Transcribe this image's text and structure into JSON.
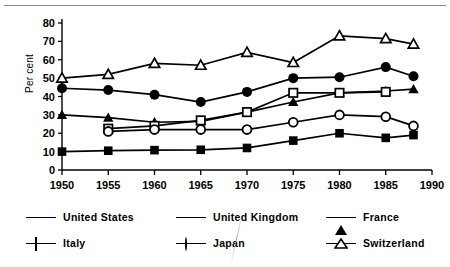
{
  "figure": {
    "toprule": true
  },
  "axes": {
    "ylabel": "Per cent",
    "yticks": [
      "0",
      "10",
      "20",
      "30",
      "40",
      "50",
      "60",
      "70",
      "80"
    ],
    "xticks": [
      "1950",
      "1955",
      "1960",
      "1965",
      "1970",
      "1975",
      "1980",
      "1985",
      "1990"
    ]
  },
  "legend": {
    "items": [
      {
        "label": "United States",
        "marker": "filled-square",
        "row": 1,
        "col": 1
      },
      {
        "label": "United Kingdom",
        "marker": "filled-circle",
        "row": 1,
        "col": 2
      },
      {
        "label": "France",
        "marker": "filled-triangle",
        "row": 1,
        "col": 3
      },
      {
        "label": "Italy",
        "marker": "open-square",
        "row": 2,
        "col": 1
      },
      {
        "label": "Japan",
        "marker": "open-circle",
        "row": 2,
        "col": 2
      },
      {
        "label": "Switzerland",
        "marker": "open-triangle",
        "row": 2,
        "col": 3
      }
    ]
  },
  "chart_data": {
    "type": "line",
    "title": "",
    "xlabel": "",
    "ylabel": "Per cent",
    "xlim": [
      1950,
      1990
    ],
    "ylim": [
      0,
      80
    ],
    "xticks": [
      1950,
      1955,
      1960,
      1965,
      1970,
      1975,
      1980,
      1985,
      1990
    ],
    "yticks": [
      0,
      10,
      20,
      30,
      40,
      50,
      60,
      70,
      80
    ],
    "grid": false,
    "legend_position": "below",
    "series": [
      {
        "name": "United States",
        "marker": "filled-square",
        "x": [
          1950,
          1955,
          1960,
          1965,
          1970,
          1975,
          1980,
          1985,
          1988
        ],
        "values": [
          10,
          10.5,
          10.8,
          11,
          12,
          16,
          20,
          17.5,
          19
        ]
      },
      {
        "name": "United Kingdom",
        "marker": "filled-circle",
        "x": [
          1950,
          1955,
          1960,
          1965,
          1970,
          1975,
          1980,
          1985,
          1988
        ],
        "values": [
          44.5,
          43.5,
          41,
          37,
          42.5,
          50,
          50.5,
          56,
          51
        ]
      },
      {
        "name": "France",
        "marker": "filled-triangle",
        "x": [
          1950,
          1955,
          1960,
          1965,
          1970,
          1975,
          1980,
          1985,
          1988
        ],
        "values": [
          30,
          28.5,
          26,
          26.5,
          31.5,
          37,
          42,
          43,
          44
        ]
      },
      {
        "name": "Italy",
        "marker": "open-square",
        "x": [
          1955,
          1960,
          1965,
          1970,
          1975,
          1980,
          1985
        ],
        "values": [
          22.5,
          24,
          27,
          31.5,
          42,
          42,
          42.5
        ]
      },
      {
        "name": "Japan",
        "marker": "open-circle",
        "x": [
          1955,
          1960,
          1965,
          1970,
          1975,
          1980,
          1985,
          1988
        ],
        "values": [
          21,
          22,
          22,
          22,
          26,
          30,
          29,
          24
        ]
      },
      {
        "name": "Switzerland",
        "marker": "open-triangle",
        "x": [
          1950,
          1955,
          1960,
          1965,
          1970,
          1975,
          1980,
          1985,
          1988
        ],
        "values": [
          50,
          52,
          58,
          57,
          64,
          58.5,
          73,
          71.5,
          68.5
        ]
      }
    ]
  }
}
